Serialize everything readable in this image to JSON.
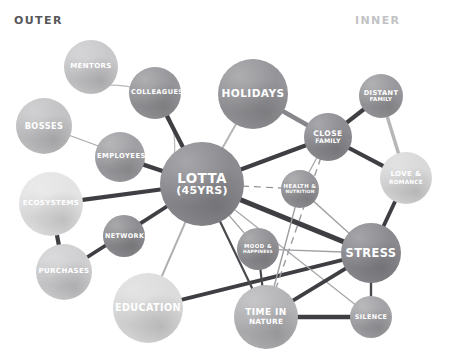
{
  "axes": {
    "outer_label": "OUTER",
    "inner_label": "INNER"
  },
  "chart_data": {
    "type": "diagram",
    "subtype": "node-link-network",
    "title": "",
    "axis_annotations": [
      "OUTER",
      "INNER"
    ],
    "node_count": 17,
    "edge_count": 31,
    "nodes": [
      {
        "id": "mentors",
        "label": "MENTORS",
        "cx": 91,
        "cy": 67,
        "r": 27,
        "color": "#c9c9cb",
        "font_size": 7.0,
        "ring": "outer"
      },
      {
        "id": "colleagues",
        "label": "COLLEAGUES",
        "cx": 155,
        "cy": 93,
        "r": 26,
        "color": "#96969a",
        "font_size": 6.6,
        "ring": "outer"
      },
      {
        "id": "bosses",
        "label": "BOSSES",
        "cx": 44,
        "cy": 126,
        "r": 28,
        "color": "#c3c3c5",
        "font_size": 8.2,
        "ring": "outer"
      },
      {
        "id": "employees",
        "label": "EMPLOYEES",
        "cx": 120,
        "cy": 157,
        "r": 25,
        "color": "#a0a0a4",
        "font_size": 6.8,
        "ring": "outer"
      },
      {
        "id": "ecosystems",
        "label": "ECOSYSTEMS",
        "cx": 51,
        "cy": 204,
        "r": 32,
        "color": "#e4e4e5",
        "font_size": 7.0,
        "ring": "outer"
      },
      {
        "id": "networks",
        "label": "NETWORKS",
        "cx": 124,
        "cy": 236,
        "r": 21,
        "color": "#8e8e92",
        "font_size": 6.4,
        "ring": "outer"
      },
      {
        "id": "purchases",
        "label": "PURCHASES",
        "cx": 64,
        "cy": 272,
        "r": 28,
        "color": "#cfcfd1",
        "font_size": 7.0,
        "ring": "outer"
      },
      {
        "id": "education",
        "label": "EDUCATION",
        "cx": 148,
        "cy": 308,
        "r": 35,
        "color": "#dcdcdd",
        "font_size": 9.6,
        "ring": "outer"
      },
      {
        "id": "lotta",
        "label": "LOTTA",
        "sub": "(45YRS)",
        "cx": 202,
        "cy": 184,
        "r": 42,
        "color": "#8b8b90",
        "font_size": 13.5,
        "ring": "center"
      },
      {
        "id": "holidays",
        "label": "HOLIDAYS",
        "cx": 253,
        "cy": 94,
        "r": 35,
        "color": "#959599",
        "font_size": 10.6,
        "ring": "inner"
      },
      {
        "id": "close_family",
        "label": "CLOSE",
        "sub": "FAMILY",
        "cx": 328,
        "cy": 137,
        "r": 24,
        "color": "#8d8d92",
        "font_size": 7.6,
        "ring": "inner"
      },
      {
        "id": "distant_family",
        "label": "DISTANT",
        "sub": "FAMILY",
        "cx": 381,
        "cy": 96,
        "r": 22,
        "color": "#99999d",
        "font_size": 6.6,
        "ring": "inner"
      },
      {
        "id": "love_romance",
        "label": "LOVE &",
        "sub": "ROMANCE",
        "cx": 406,
        "cy": 178,
        "r": 26,
        "color": "#d9d9da",
        "font_size": 7.0,
        "ring": "inner"
      },
      {
        "id": "health",
        "label": "HEALTH &",
        "sub": "NUTRITION",
        "cx": 300,
        "cy": 189,
        "r": 19,
        "color": "#959599",
        "font_size": 5.4,
        "ring": "inner"
      },
      {
        "id": "mood",
        "label": "MOOD &",
        "sub": "HAPPINESS",
        "cx": 258,
        "cy": 249,
        "r": 21,
        "color": "#919195",
        "font_size": 5.4,
        "ring": "inner"
      },
      {
        "id": "stress",
        "label": "STRESS",
        "cx": 371,
        "cy": 253,
        "r": 30,
        "color": "#8a8a8f",
        "font_size": 11.4,
        "ring": "inner"
      },
      {
        "id": "time_nature",
        "label": "TIME IN",
        "sub": "NATURE",
        "cx": 266,
        "cy": 317,
        "r": 32,
        "color": "#b4b4b7",
        "font_size": 9.0,
        "ring": "inner"
      },
      {
        "id": "silence",
        "label": "SILENCE",
        "cx": 371,
        "cy": 317,
        "r": 21,
        "color": "#a3a3a7",
        "font_size": 6.4,
        "ring": "inner"
      }
    ],
    "edges": [
      {
        "from": "mentors",
        "to": "lotta",
        "width": 1.2,
        "color": "#b9b9bb",
        "style": "curved",
        "curve": -52
      },
      {
        "from": "colleagues",
        "to": "lotta",
        "width": 4.2,
        "color": "#3f3f43",
        "style": "solid"
      },
      {
        "from": "bosses",
        "to": "lotta",
        "width": 1.2,
        "color": "#a9a9ac",
        "style": "solid"
      },
      {
        "from": "employees",
        "to": "lotta",
        "width": 4.2,
        "color": "#3f3f43",
        "style": "solid"
      },
      {
        "from": "ecosystems",
        "to": "lotta",
        "width": 4.2,
        "color": "#3f3f43",
        "style": "solid"
      },
      {
        "from": "ecosystems",
        "to": "purchases",
        "width": 4.2,
        "color": "#3f3f43",
        "style": "solid"
      },
      {
        "from": "networks",
        "to": "lotta",
        "width": 2.0,
        "color": "#b0b0b3",
        "style": "solid"
      },
      {
        "from": "purchases",
        "to": "lotta",
        "width": 3.8,
        "color": "#3f3f43",
        "style": "solid"
      },
      {
        "from": "education",
        "to": "lotta",
        "width": 2.0,
        "color": "#b0b0b3",
        "style": "solid"
      },
      {
        "from": "education",
        "to": "stress",
        "width": 3.8,
        "color": "#3f3f43",
        "style": "solid"
      },
      {
        "from": "lotta",
        "to": "holidays",
        "width": 2.0,
        "color": "#b5b5b8",
        "style": "solid"
      },
      {
        "from": "lotta",
        "to": "close_family",
        "width": 4.2,
        "color": "#3f3f43",
        "style": "solid"
      },
      {
        "from": "lotta",
        "to": "health",
        "width": 1.2,
        "color": "#8d8d91",
        "style": "dashed"
      },
      {
        "from": "lotta",
        "to": "mood",
        "width": 1.2,
        "color": "#9a9a9e",
        "style": "solid"
      },
      {
        "from": "lotta",
        "to": "stress",
        "width": 5.0,
        "color": "#3f3f43",
        "style": "solid"
      },
      {
        "from": "lotta",
        "to": "time_nature",
        "width": 2.2,
        "color": "#4a4a4e",
        "style": "solid"
      },
      {
        "from": "lotta",
        "to": "silence",
        "width": 1.2,
        "color": "#a6a6a9",
        "style": "solid"
      },
      {
        "from": "holidays",
        "to": "close_family",
        "width": 4.6,
        "color": "#86868b",
        "style": "solid"
      },
      {
        "from": "close_family",
        "to": "distant_family",
        "width": 4.2,
        "color": "#3f3f43",
        "style": "solid"
      },
      {
        "from": "close_family",
        "to": "health",
        "width": 1.2,
        "color": "#a8a8ab",
        "style": "solid"
      },
      {
        "from": "close_family",
        "to": "time_nature",
        "width": 1.4,
        "color": "#9c9ca0",
        "style": "dashed"
      },
      {
        "from": "close_family",
        "to": "love_romance",
        "width": 4.2,
        "color": "#3f3f43",
        "style": "solid"
      },
      {
        "from": "distant_family",
        "to": "love_romance",
        "width": 3.4,
        "color": "#b6b6b9",
        "style": "solid"
      },
      {
        "from": "love_romance",
        "to": "stress",
        "width": 3.8,
        "color": "#3f3f43",
        "style": "solid"
      },
      {
        "from": "health",
        "to": "stress",
        "width": 1.4,
        "color": "#a3a3a7",
        "style": "solid"
      },
      {
        "from": "health",
        "to": "time_nature",
        "width": 1.4,
        "color": "#9d9da1",
        "style": "solid"
      },
      {
        "from": "mood",
        "to": "time_nature",
        "width": 2.2,
        "color": "#4a4a4e",
        "style": "solid"
      },
      {
        "from": "mood",
        "to": "stress",
        "width": 1.4,
        "color": "#a0a0a4",
        "style": "solid"
      },
      {
        "from": "stress",
        "to": "time_nature",
        "width": 3.8,
        "color": "#3f3f43",
        "style": "solid"
      },
      {
        "from": "stress",
        "to": "silence",
        "width": 2.4,
        "color": "#4a4a4e",
        "style": "solid"
      },
      {
        "from": "time_nature",
        "to": "silence",
        "width": 4.6,
        "color": "#3f3f43",
        "style": "solid"
      }
    ]
  }
}
